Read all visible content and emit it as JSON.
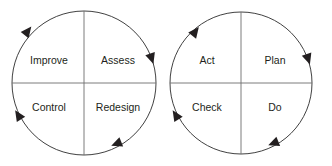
{
  "diagram": {
    "type": "two-cycle-diagram",
    "background_color": "#ffffff",
    "stroke_color": "#2b2b2b",
    "divider_color": "#6e6e6e",
    "text_color": "#231f20",
    "cycles": [
      {
        "name": "improve-assess-control-redesign-cycle",
        "direction": "clockwise",
        "center": {
          "x": 84,
          "y": 83
        },
        "radius": 72,
        "quadrants": [
          {
            "position": "top-left",
            "label": "Improve"
          },
          {
            "position": "top-right",
            "label": "Assess"
          },
          {
            "position": "bottom-left",
            "label": "Control"
          },
          {
            "position": "bottom-right",
            "label": "Redesign"
          }
        ],
        "arrows": [
          {
            "position": "upper-left",
            "angle_deg": 215
          },
          {
            "position": "right",
            "angle_deg": 340
          },
          {
            "position": "lower-right",
            "angle_deg": 65
          },
          {
            "position": "lower-left",
            "angle_deg": 145
          }
        ]
      },
      {
        "name": "pdca-cycle",
        "direction": "clockwise",
        "center": {
          "x": 241,
          "y": 83
        },
        "radius": 71,
        "quadrants": [
          {
            "position": "top-left",
            "label": "Act"
          },
          {
            "position": "top-right",
            "label": "Plan"
          },
          {
            "position": "bottom-left",
            "label": "Check"
          },
          {
            "position": "bottom-right",
            "label": "Do"
          }
        ],
        "arrows": [
          {
            "position": "upper-left",
            "angle_deg": 215
          },
          {
            "position": "right",
            "angle_deg": 340
          },
          {
            "position": "lower-right",
            "angle_deg": 65
          },
          {
            "position": "lower-left",
            "angle_deg": 145
          }
        ]
      }
    ]
  }
}
